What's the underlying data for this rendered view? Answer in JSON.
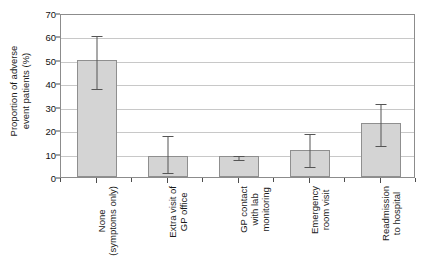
{
  "chart_data": {
    "type": "bar",
    "title": "",
    "xlabel": "",
    "ylabel_lines": [
      "Proportion of adverse",
      "event patients (%)"
    ],
    "ylabel": "Proportion of adverse event patients (%)",
    "ylim": [
      0,
      70
    ],
    "ytick_values": [
      0,
      10,
      20,
      30,
      40,
      50,
      60,
      70
    ],
    "ytick_labels": [
      "0",
      "10",
      "20",
      "30",
      "40",
      "50",
      "60",
      "70"
    ],
    "grid": true,
    "grid_axis": "y",
    "legend": "none",
    "categories": [
      "None (symptoms only)",
      "Extra visit of GP office",
      "GP contact with lab monitoring",
      "Emergency room visit",
      "Readmission to hospital"
    ],
    "category_label_lines": [
      [
        "None",
        "(symptoms only)"
      ],
      [
        "Extra visit of",
        "GP office"
      ],
      [
        "GP contact",
        "with lab",
        "monitoring"
      ],
      [
        "Emergency",
        "room visit"
      ],
      [
        "Readmission",
        "to hospital"
      ]
    ],
    "values": [
      50,
      9,
      9,
      11.5,
      23
    ],
    "error_low": [
      38.5,
      2.5,
      8,
      5,
      14
    ],
    "error_high": [
      61,
      18.5,
      10,
      19,
      32
    ],
    "bar_color": "#d4d4d4",
    "bar_edge_color": "#8f8f8f",
    "error_color": "#555555",
    "grid_color": "#c8c8c8",
    "axis_color": "#8c8c8c",
    "background_color": "#ffffff"
  }
}
